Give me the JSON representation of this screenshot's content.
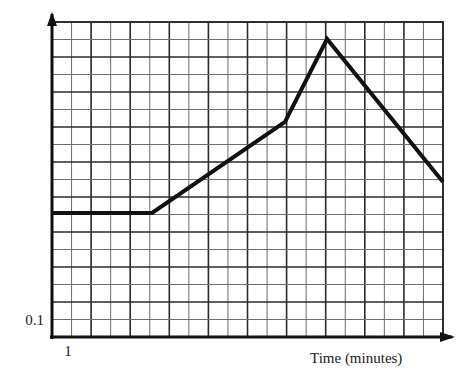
{
  "chart_data": {
    "type": "line",
    "title": "",
    "xlabel": "Time (minutes)",
    "ylabel": "",
    "grid": true,
    "legend": false,
    "x_tick_labels": [
      "1"
    ],
    "y_tick_labels": [
      "0.1"
    ],
    "axis_arrows": {
      "x": "right",
      "y": "up"
    },
    "grid_columns": 20,
    "grid_rows": 18,
    "xlim_px": [
      52,
      443
    ],
    "ylim_px": [
      337,
      22
    ],
    "series": [
      {
        "name": "curve",
        "color": "#111111",
        "line_width": 4,
        "points_px": [
          [
            52,
            213
          ],
          [
            152,
            213
          ],
          [
            285,
            122
          ],
          [
            327,
            39
          ],
          [
            443,
            182
          ]
        ],
        "description": "flat, then gradual rise, then steep rise to peak, then steady decline"
      }
    ],
    "annotations": []
  },
  "labels": {
    "x_axis": "Time (minutes)",
    "y_origin_value": "0.1",
    "x_origin_value": "1"
  },
  "colors": {
    "curve": "#111111",
    "grid_major": "#2b2b2b",
    "grid_minor": "#6e6e6e",
    "axis": "#111111",
    "background": "#ffffff",
    "text": "#1a1a1a"
  }
}
